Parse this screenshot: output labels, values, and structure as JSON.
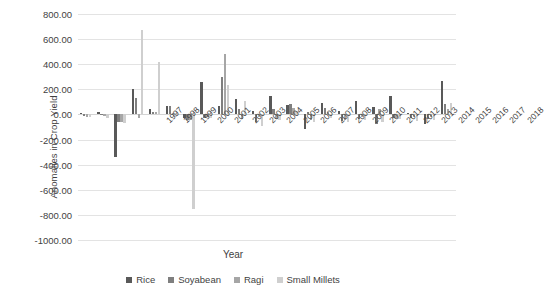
{
  "chart_data": {
    "type": "bar",
    "title": "",
    "xlabel": "Year",
    "ylabel": "Anomalies in Crop Yield",
    "ylim": [
      -1000,
      800
    ],
    "yticks": [
      800,
      600,
      400,
      200,
      0,
      -200,
      -400,
      -600,
      -800,
      -1000
    ],
    "ytick_labels": [
      "800.00",
      "600.00",
      "400.00",
      "200.00",
      "0.00",
      "-200.00",
      "-400.00",
      "-600.00",
      "-800.00",
      "-1000.00"
    ],
    "grid": true,
    "legend_position": "bottom",
    "categories": [
      "1997",
      "1998",
      "1999",
      "2000",
      "2001",
      "2002",
      "2003",
      "2004",
      "2005",
      "2006",
      "2007",
      "2008",
      "2009",
      "2010",
      "2011",
      "2012",
      "2013",
      "2014",
      "2015",
      "2016",
      "2017",
      "2018"
    ],
    "series": [
      {
        "name": "Rice",
        "color": "#595959",
        "values": [
          10,
          22,
          -340,
          205,
          40,
          70,
          -30,
          262,
          65,
          120,
          30,
          148,
          75,
          -118,
          95,
          25,
          108,
          60,
          148,
          12,
          -78,
          268
        ]
      },
      {
        "name": "Soyabean",
        "color": "#7f7f7f",
        "values": [
          -12,
          -8,
          -58,
          130,
          18,
          68,
          -42,
          -25,
          300,
          40,
          -60,
          40,
          80,
          18,
          55,
          -52,
          -35,
          -78,
          -28,
          -30,
          -40,
          82
        ]
      },
      {
        "name": "Ragi",
        "color": "#a6a6a6",
        "values": [
          -18,
          -14,
          -62,
          -30,
          20,
          10,
          -48,
          -18,
          480,
          -35,
          -18,
          -35,
          48,
          -42,
          20,
          -45,
          -20,
          42,
          -32,
          -20,
          -22,
          40
        ]
      },
      {
        "name": "Small Millets",
        "color": "#cfcfcf",
        "values": [
          -20,
          -30,
          -72,
          675,
          420,
          -22,
          -750,
          -30,
          232,
          105,
          -95,
          -48,
          30,
          -60,
          -25,
          -58,
          -42,
          -58,
          -38,
          -55,
          -48,
          95
        ]
      }
    ]
  },
  "axes": {
    "y_title": "Anomalies in Crop Yield",
    "x_title": "Year"
  },
  "legend": {
    "items": [
      {
        "label": "Rice",
        "color": "#595959"
      },
      {
        "label": "Soyabean",
        "color": "#7f7f7f"
      },
      {
        "label": "Ragi",
        "color": "#a6a6a6"
      },
      {
        "label": "Small Millets",
        "color": "#cfcfcf"
      }
    ]
  }
}
